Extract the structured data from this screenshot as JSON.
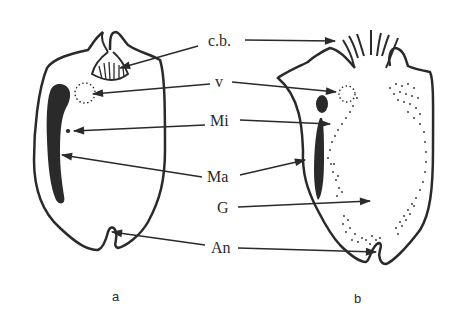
{
  "diagram": {
    "labels": {
      "cb": "c.b.",
      "v": "v",
      "mi": "Mi",
      "ma": "Ma",
      "g": "G",
      "an": "An"
    },
    "captions": {
      "a": "a",
      "b": "b"
    },
    "colors": {
      "ink": "#2a2a2a",
      "background": "#ffffff"
    }
  }
}
